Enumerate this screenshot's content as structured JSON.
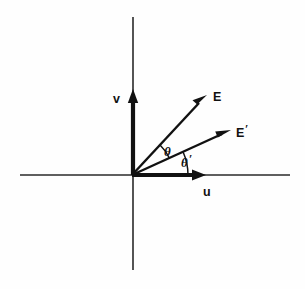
{
  "figure": {
    "type": "vector-diagram",
    "background_color": "#fefefe",
    "line_color": "#111111",
    "axis_color": "#2a2a2a"
  },
  "axes": {
    "horizontal": {
      "label": "u",
      "x_start": 20,
      "x_end": 290,
      "y": 175
    },
    "vertical": {
      "label": "v",
      "y_start": 17,
      "y_end": 270,
      "x": 133
    },
    "origin": {
      "x": 132,
      "y": 175
    }
  },
  "basis_vectors": [
    {
      "label": "u",
      "label_x": 206,
      "label_y": 193,
      "tip_x": 205,
      "tip_y": 175,
      "angle_deg": 0
    },
    {
      "label": "v",
      "label_x": 117,
      "label_y": 102,
      "tip_x": 133,
      "tip_y": 90,
      "angle_deg": 90
    }
  ],
  "field_vectors": [
    {
      "label": "E",
      "label_x": 214,
      "label_y": 100,
      "tip_x": 207,
      "tip_y": 95,
      "angle_deg": 47
    },
    {
      "label": "E",
      "prime": "′",
      "label_x": 237,
      "label_y": 136,
      "tip_x": 231,
      "tip_y": 130,
      "angle_deg": 24
    }
  ],
  "angles": [
    {
      "label": "θ",
      "label_x": 166,
      "label_y": 155,
      "arc_radius": 41,
      "from_deg": 24,
      "to_deg": 47,
      "description": "angle between E-prime and E"
    },
    {
      "label": "θ",
      "prime": "′",
      "label_x": 184,
      "label_y": 166,
      "arc_radius": 56,
      "from_deg": 0,
      "to_deg": 24,
      "description": "angle between u axis and E-prime"
    }
  ]
}
